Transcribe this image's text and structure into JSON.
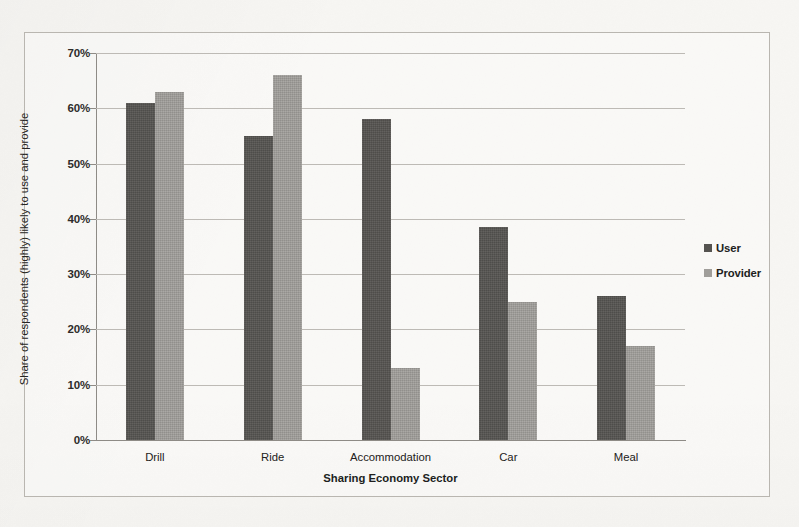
{
  "chart_data": {
    "type": "bar",
    "title": "",
    "subtitle": "",
    "xlabel": "Sharing Economy Sector",
    "ylabel": "Share of respondents (highly) likely to use and provide",
    "categories": [
      "Drill",
      "Ride",
      "Accommodation",
      "Car",
      "Meal"
    ],
    "series": [
      {
        "name": "User",
        "color": "#555350",
        "values": [
          61,
          55,
          58,
          38.5,
          26
        ]
      },
      {
        "name": "Provider",
        "color": "#a09e9a",
        "values": [
          63,
          66,
          13,
          25,
          17
        ]
      }
    ],
    "ylim": [
      0,
      70
    ],
    "ytick_values": [
      0,
      10,
      20,
      30,
      40,
      50,
      60,
      70
    ],
    "ytick_labels": [
      "0%",
      "10%",
      "20%",
      "30%",
      "40%",
      "50%",
      "60%",
      "70%"
    ],
    "grid": true,
    "grid_axis": "y",
    "legend_position": "right",
    "value_format": "percent",
    "bar_group_mode": "grouped"
  },
  "legend": {
    "entries": [
      {
        "label": "User",
        "color": "#555350"
      },
      {
        "label": "Provider",
        "color": "#a09e9a"
      }
    ]
  },
  "axes": {
    "y_title": "Share of respondents (highly) likely to use and provide",
    "x_title": "Sharing Economy Sector"
  },
  "colors": {
    "user_bar": "#555350",
    "provider_bar": "#a09e9a",
    "gridline": "#bdbab5",
    "axis_line": "#8e8b86",
    "frame_border": "#b9b6b0",
    "page_background": "#f7f6f3",
    "text": "#201e1d"
  }
}
